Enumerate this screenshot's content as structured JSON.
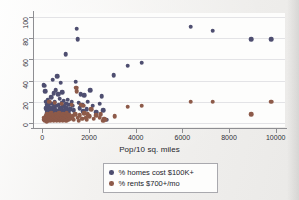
{
  "figure": {
    "background_color": "#f2f1ef",
    "plot_background_color": "#fdfdfc"
  },
  "chart_data": {
    "type": "scatter",
    "title": "",
    "xlabel": "Pop/10 sq. miles",
    "ylabel": "",
    "xlim": [
      -400,
      10400
    ],
    "ylim": [
      -4,
      104
    ],
    "xticks": [
      0,
      2000,
      4000,
      6000,
      8000,
      10000
    ],
    "yticks": [
      0,
      20,
      40,
      60,
      80,
      100
    ],
    "xtick_labels": [
      "0",
      "2000",
      "4000",
      "6000",
      "8000",
      "10000"
    ],
    "ytick_labels": [
      "0",
      "20",
      "40",
      "60",
      "80",
      "100"
    ],
    "grid": "horizontal",
    "legend_position": "below-axis-center",
    "series": [
      {
        "name": "% homes cost $100K+",
        "color": "#4e4e70",
        "points": [
          [
            60,
            36
          ],
          [
            90,
            35
          ],
          [
            120,
            30
          ],
          [
            150,
            14
          ],
          [
            170,
            20
          ],
          [
            190,
            12
          ],
          [
            200,
            17
          ],
          [
            210,
            9
          ],
          [
            230,
            22
          ],
          [
            250,
            13
          ],
          [
            260,
            6
          ],
          [
            280,
            16
          ],
          [
            300,
            11
          ],
          [
            320,
            19
          ],
          [
            340,
            8
          ],
          [
            360,
            14
          ],
          [
            380,
            24
          ],
          [
            400,
            10
          ],
          [
            420,
            18
          ],
          [
            440,
            7
          ],
          [
            450,
            41
          ],
          [
            470,
            13
          ],
          [
            490,
            28
          ],
          [
            500,
            15
          ],
          [
            520,
            9
          ],
          [
            540,
            20
          ],
          [
            560,
            12
          ],
          [
            580,
            31
          ],
          [
            600,
            16
          ],
          [
            620,
            6
          ],
          [
            640,
            44
          ],
          [
            660,
            11
          ],
          [
            680,
            27
          ],
          [
            700,
            17
          ],
          [
            720,
            10
          ],
          [
            740,
            23
          ],
          [
            760,
            14
          ],
          [
            780,
            38
          ],
          [
            800,
            8
          ],
          [
            820,
            19
          ],
          [
            840,
            13
          ],
          [
            860,
            29
          ],
          [
            880,
            16
          ],
          [
            900,
            11
          ],
          [
            920,
            21
          ],
          [
            940,
            9
          ],
          [
            960,
            15
          ],
          [
            980,
            12
          ],
          [
            1000,
            65
          ],
          [
            1020,
            18
          ],
          [
            1050,
            14
          ],
          [
            1080,
            22
          ],
          [
            1100,
            10
          ],
          [
            1150,
            17
          ],
          [
            1200,
            13
          ],
          [
            1250,
            20
          ],
          [
            1300,
            16
          ],
          [
            1350,
            12
          ],
          [
            1420,
            39
          ],
          [
            1480,
            89
          ],
          [
            1520,
            79
          ],
          [
            1560,
            19
          ],
          [
            1600,
            14
          ],
          [
            1650,
            27
          ],
          [
            1700,
            17
          ],
          [
            1750,
            11
          ],
          [
            1800,
            26
          ],
          [
            1900,
            13
          ],
          [
            1950,
            20
          ],
          [
            2050,
            31
          ],
          [
            2150,
            16
          ],
          [
            2300,
            10
          ],
          [
            2450,
            18
          ],
          [
            2550,
            25
          ],
          [
            2600,
            12
          ],
          [
            2750,
            3
          ],
          [
            3050,
            45
          ],
          [
            3650,
            54
          ],
          [
            4250,
            57
          ],
          [
            6350,
            91
          ],
          [
            7300,
            87
          ],
          [
            8950,
            79
          ],
          [
            9800,
            79
          ]
        ]
      },
      {
        "name": "% rents $700+/mo",
        "color": "#8d5a49",
        "points": [
          [
            60,
            3
          ],
          [
            90,
            5
          ],
          [
            120,
            2
          ],
          [
            150,
            6
          ],
          [
            170,
            4
          ],
          [
            190,
            1
          ],
          [
            200,
            8
          ],
          [
            210,
            3
          ],
          [
            230,
            5
          ],
          [
            250,
            2
          ],
          [
            260,
            7
          ],
          [
            280,
            4
          ],
          [
            300,
            20
          ],
          [
            320,
            3
          ],
          [
            340,
            6
          ],
          [
            360,
            2
          ],
          [
            380,
            9
          ],
          [
            400,
            5
          ],
          [
            420,
            3
          ],
          [
            440,
            7
          ],
          [
            460,
            4
          ],
          [
            480,
            2
          ],
          [
            500,
            6
          ],
          [
            520,
            19
          ],
          [
            540,
            3
          ],
          [
            560,
            5
          ],
          [
            580,
            8
          ],
          [
            600,
            4
          ],
          [
            620,
            2
          ],
          [
            640,
            7
          ],
          [
            660,
            3
          ],
          [
            680,
            6
          ],
          [
            700,
            5
          ],
          [
            720,
            9
          ],
          [
            740,
            2
          ],
          [
            760,
            4
          ],
          [
            780,
            7
          ],
          [
            800,
            3
          ],
          [
            820,
            6
          ],
          [
            840,
            18
          ],
          [
            860,
            4
          ],
          [
            880,
            2
          ],
          [
            900,
            8
          ],
          [
            920,
            5
          ],
          [
            940,
            3
          ],
          [
            960,
            7
          ],
          [
            980,
            4
          ],
          [
            1000,
            6
          ],
          [
            1020,
            2
          ],
          [
            1050,
            9
          ],
          [
            1080,
            5
          ],
          [
            1100,
            3
          ],
          [
            1150,
            7
          ],
          [
            1200,
            4
          ],
          [
            1250,
            17
          ],
          [
            1300,
            6
          ],
          [
            1350,
            3
          ],
          [
            1400,
            8
          ],
          [
            1450,
            33
          ],
          [
            1480,
            30
          ],
          [
            1520,
            5
          ],
          [
            1560,
            2
          ],
          [
            1600,
            7
          ],
          [
            1650,
            17
          ],
          [
            1700,
            4
          ],
          [
            1750,
            16
          ],
          [
            1800,
            9
          ],
          [
            1850,
            5
          ],
          [
            1900,
            3
          ],
          [
            1950,
            8
          ],
          [
            2000,
            6
          ],
          [
            2100,
            13
          ],
          [
            2200,
            4
          ],
          [
            2300,
            7
          ],
          [
            2450,
            5
          ],
          [
            2500,
            8
          ],
          [
            2600,
            2
          ],
          [
            2650,
            4
          ],
          [
            2700,
            3
          ],
          [
            3100,
            6
          ],
          [
            3650,
            15
          ],
          [
            4250,
            16
          ],
          [
            6350,
            20
          ],
          [
            7300,
            20
          ],
          [
            8950,
            8
          ],
          [
            9800,
            20
          ]
        ]
      }
    ]
  },
  "legend": {
    "entries": [
      {
        "label": "% homes cost $100K+"
      },
      {
        "label": "% rents $700+/mo"
      }
    ]
  }
}
